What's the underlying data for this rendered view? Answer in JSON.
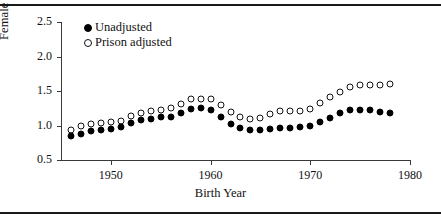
{
  "chart_data": {
    "type": "scatter",
    "title": "",
    "xlabel": "Birth Year",
    "ylabel": "Female to Male Odds Ratio",
    "xlim": [
      1945,
      1980
    ],
    "ylim": [
      0.5,
      2.5
    ],
    "xticks": [
      1950,
      1960,
      1970,
      1980
    ],
    "yticks": [
      "0.5",
      "1.0",
      "1.5",
      "2.0",
      "2.5"
    ],
    "grid": false,
    "legend_position": "top-left",
    "x": [
      1946,
      1947,
      1948,
      1949,
      1950,
      1951,
      1952,
      1953,
      1954,
      1955,
      1956,
      1957,
      1958,
      1959,
      1960,
      1961,
      1962,
      1963,
      1964,
      1965,
      1966,
      1967,
      1968,
      1969,
      1970,
      1971,
      1972,
      1973,
      1974,
      1975,
      1976,
      1977,
      1978
    ],
    "series": [
      {
        "name": "Unadjusted",
        "marker": "filled-circle",
        "color": "#000000",
        "values": [
          0.85,
          0.88,
          0.92,
          0.94,
          0.95,
          0.98,
          1.03,
          1.08,
          1.09,
          1.12,
          1.13,
          1.18,
          1.24,
          1.25,
          1.23,
          1.13,
          1.02,
          0.96,
          0.93,
          0.93,
          0.95,
          0.97,
          0.97,
          0.98,
          1.0,
          1.05,
          1.11,
          1.18,
          1.22,
          1.22,
          1.22,
          1.2,
          1.18
        ]
      },
      {
        "name": "Prison adjusted",
        "marker": "open-circle",
        "color": "#111111",
        "values": [
          0.94,
          0.99,
          1.02,
          1.04,
          1.05,
          1.07,
          1.14,
          1.18,
          1.21,
          1.22,
          1.25,
          1.31,
          1.38,
          1.38,
          1.38,
          1.29,
          1.19,
          1.12,
          1.1,
          1.11,
          1.17,
          1.21,
          1.21,
          1.21,
          1.24,
          1.32,
          1.41,
          1.49,
          1.56,
          1.59,
          1.59,
          1.58,
          1.6
        ]
      }
    ]
  },
  "legend": {
    "items": [
      {
        "label": "Unadjusted",
        "marker": "filled-circle"
      },
      {
        "label": "Prison adjusted",
        "marker": "open-circle"
      }
    ]
  }
}
